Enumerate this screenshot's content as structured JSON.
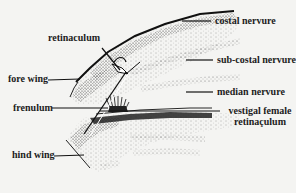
{
  "figure": {
    "background": "#f4f4f2",
    "ink": "#1c1c1c"
  },
  "labels": {
    "retinaculum": "retinaculum",
    "fore_wing": "fore wing",
    "frenulum": "frenulum",
    "hind_wing": "hind wing",
    "costal_nervure": "costal nervure",
    "sub_costal_nervure": "sub-costal nervure",
    "median_nervure": "median nervure",
    "vestigal_female_line1": "vestigal female",
    "vestigal_female_line2": "retinaçulum"
  }
}
